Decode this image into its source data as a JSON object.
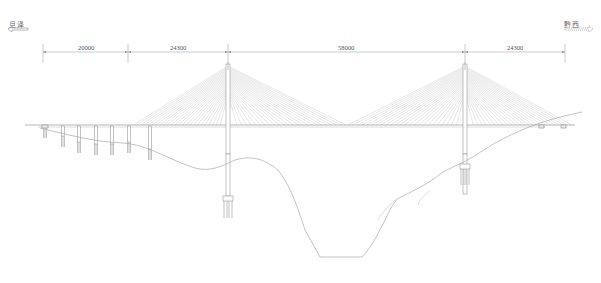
{
  "drawing": {
    "type": "cable-stayed bridge elevation",
    "direction_left": {
      "label": "旦泽",
      "arrow": "left-arrow"
    },
    "direction_right": {
      "label": "黔西",
      "arrow": "right-arrow"
    },
    "spans": [
      {
        "label": "20000",
        "x1": 43,
        "x2": 128
      },
      {
        "label": "24300",
        "x1": 128,
        "x2": 228
      },
      {
        "label": "58000",
        "x1": 228,
        "x2": 465
      },
      {
        "label": "24300",
        "x1": 465,
        "x2": 565
      }
    ],
    "dimension_line_y": 52,
    "deck_y": 125,
    "deck_x1": 25,
    "deck_x2": 575,
    "towers": [
      {
        "name": "left-tower",
        "x": 228,
        "top": 64,
        "base": 215
      },
      {
        "name": "right-tower",
        "x": 465,
        "top": 64,
        "base": 213
      }
    ],
    "approach_piers": [
      {
        "x": 45,
        "bottom": 138
      },
      {
        "x": 63,
        "bottom": 147
      },
      {
        "x": 79,
        "bottom": 153
      },
      {
        "x": 96,
        "bottom": 155
      },
      {
        "x": 112,
        "bottom": 155
      },
      {
        "x": 129,
        "bottom": 153
      },
      {
        "x": 150,
        "bottom": 160
      }
    ],
    "abutments": [
      {
        "x": 541
      },
      {
        "x": 563
      }
    ],
    "colors": {
      "line": "#9a9a9a",
      "cable": "#b8b8b8",
      "text": "#555555",
      "background": "#ffffff"
    }
  }
}
